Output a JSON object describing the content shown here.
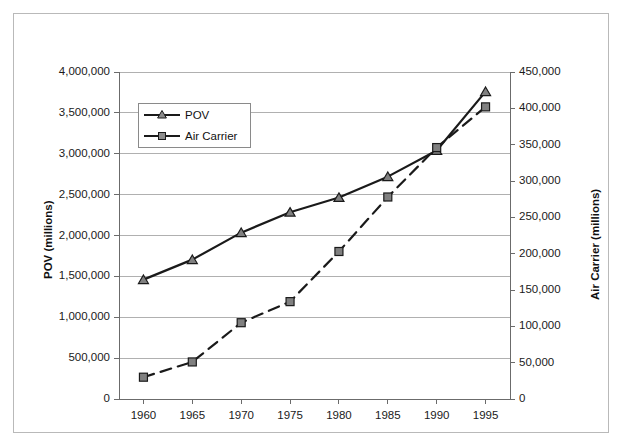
{
  "chart_data": {
    "type": "line",
    "title": "",
    "subtitle": "",
    "xlabel": "",
    "ylabel": "POV (millions)",
    "ylabel_secondary": "Air Carrier (millions)",
    "grid": true,
    "legend_position": "upper-left-inside",
    "x": [
      1960,
      1965,
      1970,
      1975,
      1980,
      1985,
      1990,
      1995
    ],
    "xticklabels": [
      "1960",
      "1965",
      "1970",
      "1975",
      "1980",
      "1985",
      "1990",
      "1995"
    ],
    "xlim": [
      1957.5,
      1997.5
    ],
    "ylim": [
      0,
      4000000
    ],
    "yticks": [
      0,
      500000,
      1000000,
      1500000,
      2000000,
      2500000,
      3000000,
      3500000,
      4000000
    ],
    "yticklabels": [
      "0",
      "500,000",
      "1,000,000",
      "1,500,000",
      "2,000,000",
      "2,500,000",
      "3,000,000",
      "3,500,000",
      "4,000,000"
    ],
    "ylim_secondary": [
      0,
      450000
    ],
    "yticks_secondary": [
      0,
      50000,
      100000,
      150000,
      200000,
      250000,
      300000,
      350000,
      400000,
      450000
    ],
    "yticklabels_secondary": [
      "0",
      "50,000",
      "100,000",
      "150,000",
      "200,000",
      "250,000",
      "300,000",
      "350,000",
      "400,000",
      "450,000"
    ],
    "series": [
      {
        "name": "POV",
        "axis": "left",
        "marker": "triangle",
        "linestyle": "solid",
        "color": "#1a1a1a",
        "values": [
          1460000,
          1705000,
          2035000,
          2285000,
          2465000,
          2720000,
          3040000,
          3760000
        ]
      },
      {
        "name": "Air Carrier",
        "axis": "right",
        "marker": "square",
        "linestyle": "dashed",
        "color": "#1a1a1a",
        "values": [
          30000,
          51000,
          105000,
          134000,
          203000,
          278000,
          346000,
          402000
        ]
      }
    ]
  },
  "legend": {
    "entries": [
      {
        "label": "POV",
        "marker": "triangle-marker-icon"
      },
      {
        "label": "Air Carrier",
        "marker": "square-marker-icon"
      }
    ]
  },
  "colors": {
    "line": "#1a1a1a",
    "marker_fill": "#808080",
    "grid": "#b0b0b0",
    "axis": "#6b6b6b",
    "border": "#b9b9b9",
    "text": "#111111"
  }
}
